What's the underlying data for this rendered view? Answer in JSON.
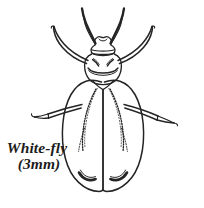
{
  "figure": {
    "background_color": "#ffffff",
    "ink_color": "#242424",
    "caption": {
      "line1": "White-fly",
      "line2": "(3mm)"
    },
    "parts": [
      "left-antenna",
      "right-antenna",
      "head",
      "thorax",
      "left-forewing",
      "right-forewing",
      "left-front-leg",
      "right-front-leg",
      "left-middle-leg",
      "right-middle-leg"
    ]
  }
}
